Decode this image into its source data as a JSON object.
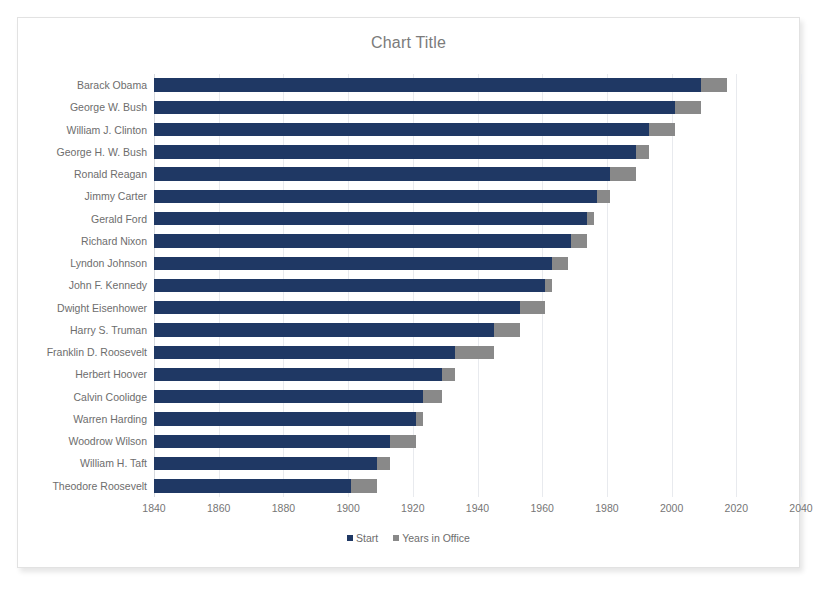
{
  "chart_data": {
    "type": "bar",
    "subtype": "stacked-horizontal-bar",
    "title": "Chart Title",
    "xlabel": "",
    "ylabel": "",
    "xlim": [
      1840,
      2040
    ],
    "xticks": [
      1840,
      1860,
      1880,
      1900,
      1920,
      1940,
      1960,
      1980,
      2000,
      2020,
      2040
    ],
    "grid": true,
    "legend_position": "bottom",
    "legend": [
      "Start",
      "Years in Office"
    ],
    "colors": {
      "start": "#1f3864",
      "years_in_office": "#898989",
      "title": "#7b7b7b",
      "label": "#6d6d6d",
      "gridline": "#e8eaee",
      "frame_border": "#e2e2e2",
      "background": "#ffffff"
    },
    "categories": [
      "Barack Obama",
      "George W. Bush",
      "William J. Clinton",
      "George H. W. Bush",
      "Ronald Reagan",
      "Jimmy Carter",
      "Gerald Ford",
      "Richard Nixon",
      "Lyndon Johnson",
      "John F. Kennedy",
      "Dwight Eisenhower",
      "Harry S. Truman",
      "Franklin D. Roosevelt",
      "Herbert Hoover",
      "Calvin Coolidge",
      "Warren Harding",
      "Woodrow Wilson",
      "William H. Taft",
      "Theodore Roosevelt"
    ],
    "series": [
      {
        "name": "Start",
        "values": [
          2009,
          2001,
          1993,
          1989,
          1981,
          1977,
          1974,
          1969,
          1963,
          1961,
          1953,
          1945,
          1933,
          1929,
          1923,
          1921,
          1913,
          1909,
          1901
        ]
      },
      {
        "name": "Years in Office",
        "values": [
          8,
          8,
          8,
          4,
          8,
          4,
          2,
          5,
          5,
          2,
          8,
          8,
          12,
          4,
          6,
          2,
          8,
          4,
          8
        ]
      }
    ]
  }
}
